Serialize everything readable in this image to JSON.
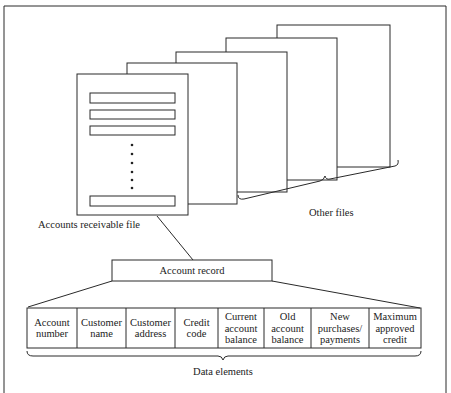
{
  "diagram": {
    "file_label": "Accounts receivable file",
    "other_files_label": "Other files",
    "record_label": "Account record",
    "data_elements_label": "Data elements",
    "fields": [
      {
        "lines": [
          "Account",
          "number"
        ]
      },
      {
        "lines": [
          "Customer",
          "name"
        ]
      },
      {
        "lines": [
          "Customer",
          "address"
        ]
      },
      {
        "lines": [
          "Credit",
          "code"
        ]
      },
      {
        "lines": [
          "Current",
          "account",
          "balance"
        ]
      },
      {
        "lines": [
          "Old",
          "account",
          "balance"
        ]
      },
      {
        "lines": [
          "New",
          "purchases/",
          "payments"
        ]
      },
      {
        "lines": [
          "Maximum",
          "approved",
          "credit"
        ]
      }
    ],
    "colors": {
      "line": "#2a2a2a",
      "text": "#222222",
      "background": "#ffffff"
    }
  }
}
